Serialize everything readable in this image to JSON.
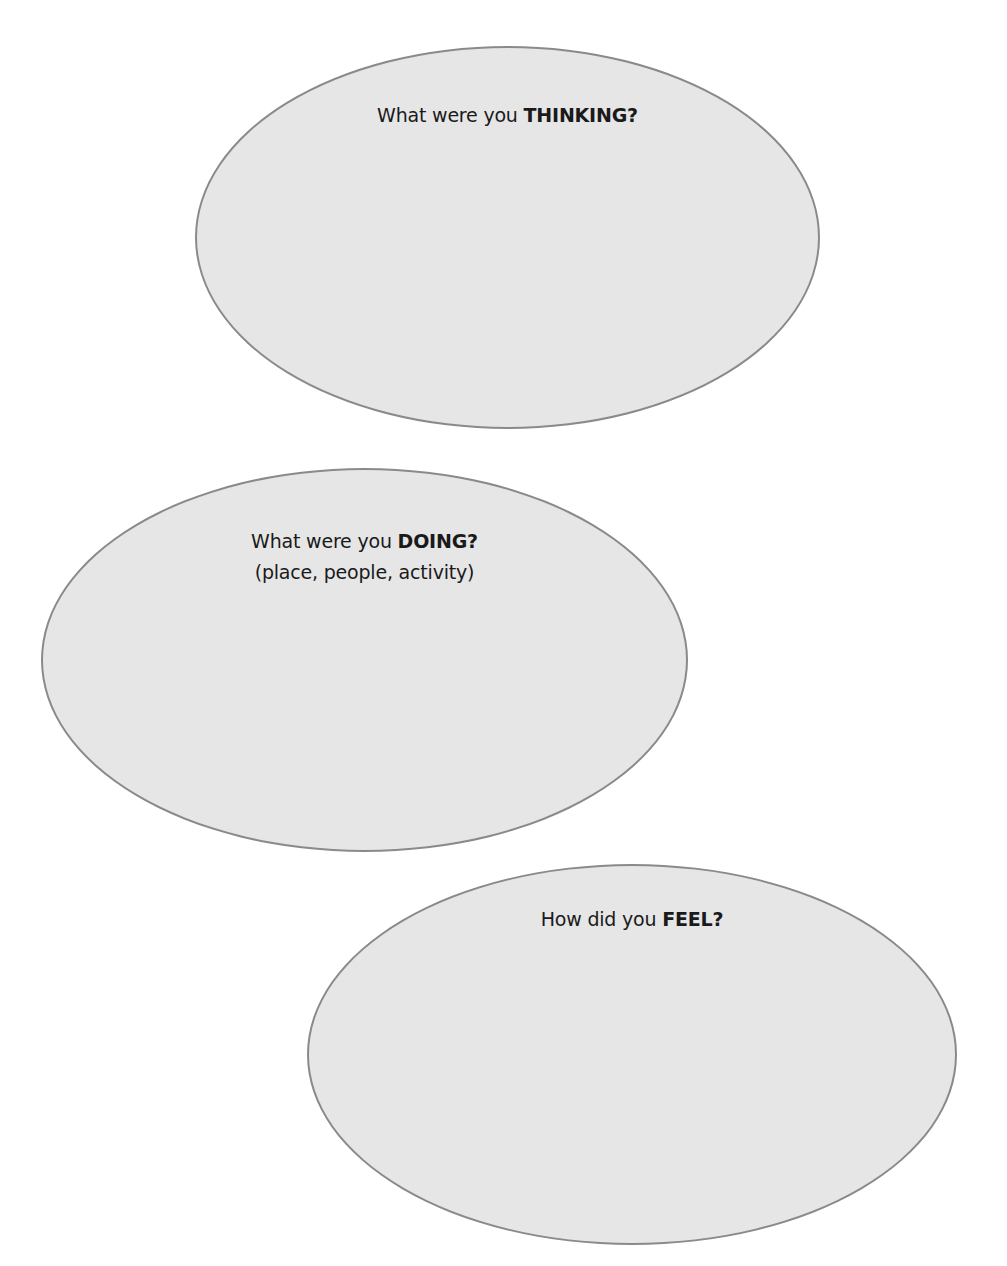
{
  "page": {
    "cut_off_text": ""
  },
  "bubbles": [
    {
      "id": "thinking",
      "prompt_prefix": "What were you ",
      "prompt_emphasis": "THINKING",
      "prompt_suffix": "?",
      "subtitle": ""
    },
    {
      "id": "doing",
      "prompt_prefix": "What were you ",
      "prompt_emphasis": "DOING",
      "prompt_suffix": "?",
      "subtitle": "(place, people, activity)"
    },
    {
      "id": "feel",
      "prompt_prefix": "How did you ",
      "prompt_emphasis": "FEEL",
      "prompt_suffix": "?",
      "subtitle": ""
    }
  ],
  "colors": {
    "bubble_fill": "#e6e6e6",
    "bubble_stroke": "#8a8a8a",
    "text": "#1a1a1a",
    "background": "#ffffff"
  }
}
